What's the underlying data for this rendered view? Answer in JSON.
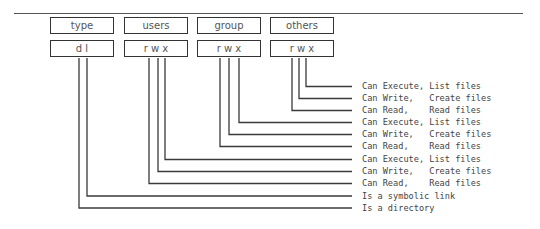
{
  "header_boxes": [
    {
      "label": "type",
      "value": "d l"
    },
    {
      "label": "users",
      "value": "r w x"
    },
    {
      "label": "group",
      "value": "r w x"
    },
    {
      "label": "others",
      "value": "r w x"
    }
  ],
  "descriptions": [
    "Can Execute, List files",
    "Can Write,   Create files",
    "Can Read,    Read files",
    "Can Execute, List files",
    "Can Write,   Create files",
    "Can Read,    Read files",
    "Can Execute, List files",
    "Can Write,   Create files",
    "Can Read,    Read files",
    "Is a symbolic link",
    "Is a directory"
  ],
  "colors": {
    "line": "#333333",
    "text": "#444444",
    "box_border": "#333333"
  }
}
